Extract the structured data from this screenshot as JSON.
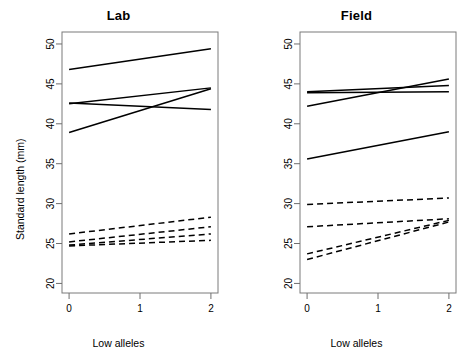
{
  "figure": {
    "ylabel": "Standard length (mm)",
    "xlabel": "Low alleles",
    "line_color": "#000000"
  },
  "panels": [
    {
      "key": "lab",
      "title": "Lab"
    },
    {
      "key": "field",
      "title": "Field"
    }
  ],
  "axis": {
    "y_ticks": [
      "20",
      "25",
      "30",
      "35",
      "40",
      "45",
      "50"
    ],
    "x_ticks": [
      "0",
      "1",
      "2"
    ],
    "ylim": [
      18.8,
      51.5
    ],
    "xlim": [
      -0.1,
      2.1
    ]
  },
  "chart_data": [
    {
      "type": "line",
      "title": "Lab",
      "xlabel": "Low alleles",
      "ylabel": "Standard length (mm)",
      "xlim": [
        -0.1,
        2.1
      ],
      "ylim": [
        18.8,
        51.5
      ],
      "x": [
        0,
        2
      ],
      "grid": false,
      "legend": "none",
      "series": [
        {
          "name": "lab-solid-1",
          "style": "solid",
          "values": [
            46.8,
            49.4
          ]
        },
        {
          "name": "lab-solid-2",
          "style": "solid",
          "values": [
            42.5,
            44.5
          ]
        },
        {
          "name": "lab-solid-3",
          "style": "solid",
          "values": [
            42.6,
            41.8
          ]
        },
        {
          "name": "lab-solid-4",
          "style": "solid",
          "values": [
            38.9,
            44.4
          ]
        },
        {
          "name": "lab-dashed-1",
          "style": "dashed",
          "values": [
            26.2,
            28.3
          ]
        },
        {
          "name": "lab-dashed-2",
          "style": "dashed",
          "values": [
            25.2,
            27.1
          ]
        },
        {
          "name": "lab-dashed-3",
          "style": "dashed",
          "values": [
            24.8,
            26.2
          ]
        },
        {
          "name": "lab-dashed-4",
          "style": "dashed",
          "values": [
            24.7,
            25.4
          ]
        }
      ]
    },
    {
      "type": "line",
      "title": "Field",
      "xlabel": "Low alleles",
      "ylabel": "Standard length (mm)",
      "xlim": [
        -0.1,
        2.1
      ],
      "ylim": [
        18.8,
        51.5
      ],
      "x": [
        0,
        2
      ],
      "grid": false,
      "legend": "none",
      "series": [
        {
          "name": "field-solid-1",
          "style": "solid",
          "values": [
            44.0,
            44.8
          ]
        },
        {
          "name": "field-solid-2",
          "style": "solid",
          "values": [
            43.9,
            44.0
          ]
        },
        {
          "name": "field-solid-3",
          "style": "solid",
          "values": [
            42.2,
            45.6
          ]
        },
        {
          "name": "field-solid-4",
          "style": "solid",
          "values": [
            35.6,
            39.0
          ]
        },
        {
          "name": "field-dashed-1",
          "style": "dashed",
          "values": [
            29.9,
            30.7
          ]
        },
        {
          "name": "field-dashed-2",
          "style": "dashed",
          "values": [
            27.1,
            28.1
          ]
        },
        {
          "name": "field-dashed-3",
          "style": "dashed",
          "values": [
            23.7,
            27.9
          ]
        },
        {
          "name": "field-dashed-4",
          "style": "dashed",
          "values": [
            23.0,
            27.7
          ]
        }
      ]
    }
  ]
}
